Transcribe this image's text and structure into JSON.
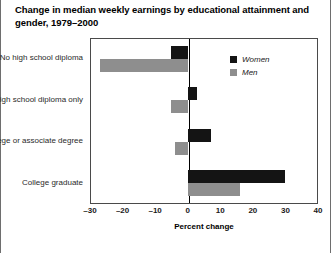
{
  "title": "Change in median weekly earnings by educational attainment and gender, 1979–2000",
  "legend": {
    "position": "top-right",
    "entries": [
      {
        "label": "Women",
        "color": "#141414",
        "swatch": "legend-swatch-women"
      },
      {
        "label": "Men",
        "color": "#8e8e8e",
        "swatch": "legend-swatch-men"
      }
    ]
  },
  "axis": {
    "xlabel": "Percent change",
    "ticks": [
      "–30",
      "–20",
      "–10",
      "0",
      "10",
      "20",
      "30",
      "40"
    ]
  },
  "chart_data": {
    "type": "bar",
    "orientation": "horizontal",
    "title": "Change in median weekly earnings by educational attainment and gender, 1979–2000",
    "xlabel": "Percent change",
    "ylabel": "",
    "xlim": [
      -30,
      40
    ],
    "xticks": [
      -30,
      -20,
      -10,
      0,
      10,
      20,
      30,
      40
    ],
    "grid": false,
    "legend_position": "top-right",
    "categories": [
      "No high school diploma",
      "High school diploma only",
      "Some college or associate degree",
      "College graduate"
    ],
    "series": [
      {
        "name": "Women",
        "color": "#141414",
        "values": [
          -5,
          3,
          7,
          30
        ]
      },
      {
        "name": "Men",
        "color": "#8e8e8e",
        "values": [
          -27,
          -5,
          -4,
          16
        ]
      }
    ]
  }
}
